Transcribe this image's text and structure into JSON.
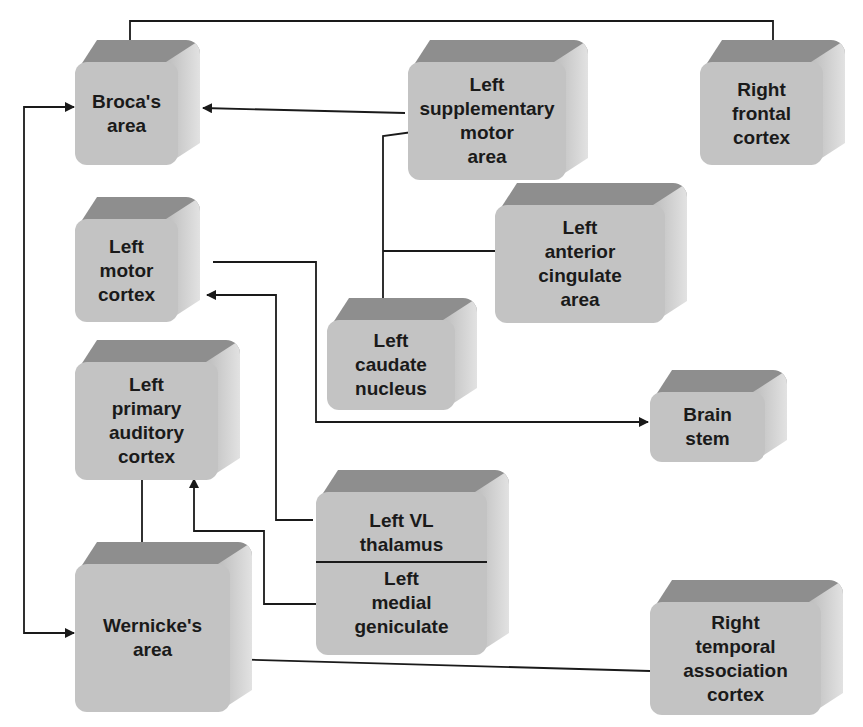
{
  "diagram": {
    "title": "",
    "nodes": [
      {
        "id": "brocas_area",
        "lines": [
          "Broca's",
          "area"
        ],
        "x": 75,
        "y": 40,
        "w": 125,
        "h": 125
      },
      {
        "id": "left_sma",
        "lines": [
          "Left",
          "supplementary",
          "motor",
          "area"
        ],
        "x": 408,
        "y": 40,
        "w": 180,
        "h": 140
      },
      {
        "id": "right_frontal",
        "lines": [
          "Right",
          "frontal",
          "cortex"
        ],
        "x": 700,
        "y": 40,
        "w": 145,
        "h": 125
      },
      {
        "id": "left_motor_cortex",
        "lines": [
          "Left",
          "motor",
          "cortex"
        ],
        "x": 75,
        "y": 197,
        "w": 125,
        "h": 125
      },
      {
        "id": "left_anterior_cingulate",
        "lines": [
          "Left",
          "anterior",
          "cingulate",
          "area"
        ],
        "x": 495,
        "y": 183,
        "w": 192,
        "h": 140
      },
      {
        "id": "left_caudate",
        "lines": [
          "Left",
          "caudate",
          "nucleus"
        ],
        "x": 327,
        "y": 298,
        "w": 150,
        "h": 112
      },
      {
        "id": "left_primary_auditory",
        "lines": [
          "Left",
          "primary",
          "auditory",
          "cortex"
        ],
        "x": 75,
        "y": 340,
        "w": 165,
        "h": 140
      },
      {
        "id": "brain_stem",
        "lines": [
          "Brain",
          "stem"
        ],
        "x": 650,
        "y": 370,
        "w": 137,
        "h": 92
      },
      {
        "id": "left_vl_thalamus_medial_geniculate",
        "lines": [
          "Left VL",
          "thalamus"
        ],
        "lines2": [
          "Left",
          "medial",
          "geniculate"
        ],
        "x": 316,
        "y": 470,
        "w": 193,
        "h": 185
      },
      {
        "id": "wernickes_area",
        "lines": [
          "Wernicke's",
          "area"
        ],
        "x": 75,
        "y": 542,
        "w": 177,
        "h": 170
      },
      {
        "id": "right_temporal_association",
        "lines": [
          "Right",
          "temporal",
          "association",
          "cortex"
        ],
        "x": 650,
        "y": 580,
        "w": 193,
        "h": 135
      }
    ],
    "edges": [
      {
        "from": "right_frontal",
        "to": "brocas_area"
      },
      {
        "from": "left_sma",
        "to": "brocas_area"
      },
      {
        "from": "left_sma",
        "to": "left_caudate"
      },
      {
        "from": "left_anterior_cingulate",
        "to": "left_caudate"
      },
      {
        "from": "left_motor_cortex",
        "to": "brain_stem"
      },
      {
        "from": "left_vl_thalamus",
        "to": "left_motor_cortex"
      },
      {
        "from": "left_medial_geniculate",
        "to": "left_primary_auditory"
      },
      {
        "from": "left_primary_auditory",
        "to": "wernickes_area"
      },
      {
        "from": "right_temporal_association",
        "to": "wernickes_area"
      },
      {
        "from": "brocas_area",
        "to": "wernickes_area",
        "bidirectional": true
      }
    ],
    "colors": {
      "face": "#c3c3c3",
      "top": "#8e8e8e",
      "side": "#d8d8d8",
      "line": "#1a1a1a"
    }
  }
}
